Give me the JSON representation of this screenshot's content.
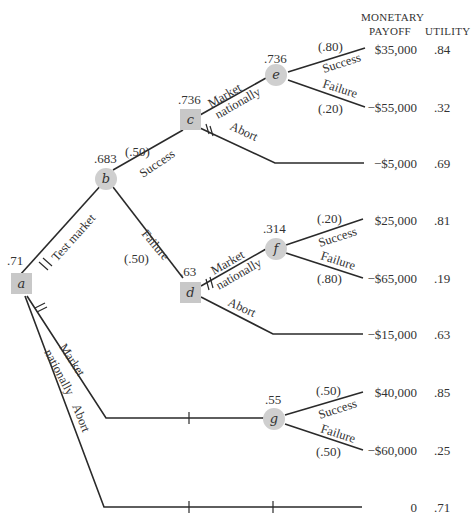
{
  "header": {
    "monetary_line1": "MONETARY",
    "monetary_line2": "PAYOFF",
    "utility": "UTILITY"
  },
  "nodes": {
    "a": {
      "label": "a",
      "type": "decision",
      "value": ".71"
    },
    "b": {
      "label": "b",
      "type": "chance",
      "value": ".683"
    },
    "c": {
      "label": "c",
      "type": "decision",
      "value": ".736"
    },
    "d": {
      "label": "d",
      "type": "decision",
      "value": ".63"
    },
    "e": {
      "label": "e",
      "type": "chance",
      "value": ".736"
    },
    "f": {
      "label": "f",
      "type": "chance",
      "value": ".314"
    },
    "g": {
      "label": "g",
      "type": "chance",
      "value": ".55"
    }
  },
  "branches": {
    "a_test_market": "Test market",
    "a_market_1": "Market",
    "a_market_2": "nationally",
    "a_abort": "Abort",
    "b_success": "Success",
    "b_success_prob": "(.50)",
    "b_failure": "Failure",
    "b_failure_prob": "(.50)",
    "c_market_1": "Market",
    "c_market_2": "nationally",
    "c_abort": "Abort",
    "d_market_1": "Market",
    "d_market_2": "nationally",
    "d_abort": "Abort",
    "e_success": "Success",
    "e_success_prob": "(.80)",
    "e_failure": "Failure",
    "e_failure_prob": "(.20)",
    "f_success": "Success",
    "f_success_prob": "(.20)",
    "f_failure": "Failure",
    "f_failure_prob": "(.80)",
    "g_success": "Success",
    "g_success_prob": "(.50)",
    "g_failure": "Failure",
    "g_failure_prob": "(.50)"
  },
  "outcomes": [
    {
      "payoff": "$35,000",
      "utility": ".84"
    },
    {
      "payoff": "−$55,000",
      "utility": ".32"
    },
    {
      "payoff": "−$5,000",
      "utility": ".69"
    },
    {
      "payoff": "$25,000",
      "utility": ".81"
    },
    {
      "payoff": "−$65,000",
      "utility": ".19"
    },
    {
      "payoff": "−$15,000",
      "utility": ".63"
    },
    {
      "payoff": "$40,000",
      "utility": ".85"
    },
    {
      "payoff": "−$60,000",
      "utility": ".25"
    },
    {
      "payoff": "0",
      "utility": ".71"
    }
  ]
}
